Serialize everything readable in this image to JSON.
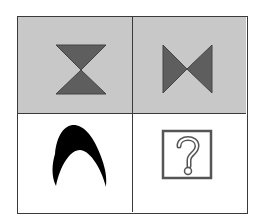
{
  "puzzle": {
    "type": "2x2 figure matrix",
    "cells": [
      {
        "row": 0,
        "col": 0,
        "shape": "hourglass-triangles",
        "fill": "#5e5e5e",
        "background": "#c8c8c8"
      },
      {
        "row": 0,
        "col": 1,
        "shape": "bowtie-triangles",
        "fill": "#5e5e5e",
        "background": "#c8c8c8"
      },
      {
        "row": 1,
        "col": 0,
        "shape": "black-arch",
        "fill": "#000000",
        "background": "#ffffff"
      },
      {
        "row": 1,
        "col": 1,
        "shape": "question-box",
        "symbol": "?",
        "background": "#ffffff"
      }
    ]
  }
}
